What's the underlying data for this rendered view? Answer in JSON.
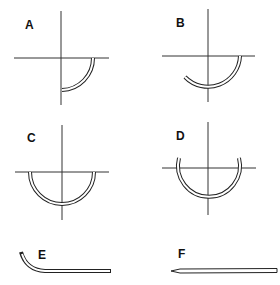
{
  "figure": {
    "panels": [
      {
        "id": "A",
        "label": "A",
        "shape": "1/4 circle"
      },
      {
        "id": "B",
        "label": "B",
        "shape": "3/8 circle"
      },
      {
        "id": "C",
        "label": "C",
        "shape": "1/2 circle"
      },
      {
        "id": "D",
        "label": "D",
        "shape": "5/8 circle"
      },
      {
        "id": "E",
        "label": "E",
        "shape": "half-curved (ski)"
      },
      {
        "id": "F",
        "label": "F",
        "shape": "straight"
      }
    ],
    "colors": {
      "line": "#222222",
      "background": "#ffffff"
    }
  }
}
